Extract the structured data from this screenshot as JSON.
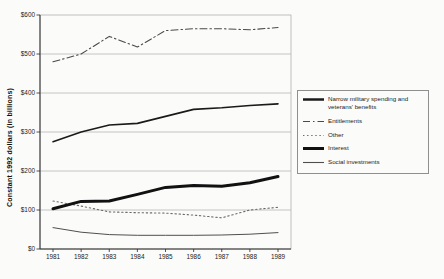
{
  "figure": {
    "background_color": "#fbfbf9"
  },
  "chart_data": {
    "type": "line",
    "title": "",
    "xlabel": "",
    "ylabel": "Constant 1992 dollars (in billions)",
    "x_labels": [
      "1981",
      "1982",
      "1983",
      "1984",
      "1985",
      "1986",
      "1987",
      "1988",
      "1989"
    ],
    "y_ticks": [
      0,
      100,
      200,
      300,
      400,
      500,
      600
    ],
    "y_tick_labels": [
      "$0",
      "$100",
      "$200",
      "$300",
      "$400",
      "$500",
      "$600"
    ],
    "ylim": [
      0,
      600
    ],
    "grid": "horizontal gridlines at each $100",
    "legend_position": "right, boxed",
    "series": [
      {
        "name": "Narrow military spending and veterans' benefits",
        "style": "solid",
        "width": 1.6,
        "color": "#1a1a1a",
        "values": [
          275,
          300,
          318,
          322,
          340,
          358,
          362,
          368,
          372
        ]
      },
      {
        "name": "Entitlements",
        "style": "dashdot",
        "width": 1.1,
        "color": "#4a4a4a",
        "values": [
          480,
          500,
          545,
          518,
          560,
          565,
          565,
          562,
          568
        ]
      },
      {
        "name": "Other",
        "style": "dotted",
        "width": 1.1,
        "color": "#6a6a6a",
        "values": [
          123,
          110,
          95,
          93,
          92,
          87,
          80,
          100,
          107
        ]
      },
      {
        "name": "Interest",
        "style": "solid",
        "width": 3,
        "color": "#111111",
        "values": [
          103,
          122,
          123,
          140,
          158,
          163,
          161,
          170,
          186
        ]
      },
      {
        "name": "Social investments",
        "style": "solid",
        "width": 1,
        "color": "#4f4f4f",
        "values": [
          55,
          43,
          37,
          35,
          35,
          35,
          36,
          38,
          42
        ]
      }
    ]
  }
}
